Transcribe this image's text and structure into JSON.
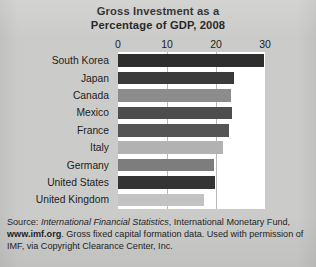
{
  "chart_data": {
    "type": "bar",
    "orientation": "horizontal",
    "title": "Gross Investment as a Percentage of GDP, 2008",
    "title_lines": [
      "Gross Investment as a",
      "Percentage of GDP, 2008"
    ],
    "xlabel": "",
    "ylabel": "",
    "xlim": [
      0,
      30
    ],
    "xticks": [
      0,
      10,
      20,
      30
    ],
    "xtick_labels": [
      "0",
      "10",
      "20",
      "30"
    ],
    "grid": true,
    "grid_axis": "x",
    "legend": "none",
    "categories": [
      "South Korea",
      "Japan",
      "Canada",
      "Mexico",
      "France",
      "Italy",
      "Germany",
      "United States",
      "United Kingdom"
    ],
    "values": [
      29.8,
      23.7,
      23.0,
      23.2,
      22.7,
      21.4,
      19.6,
      19.8,
      17.5
    ],
    "bar_colors": [
      "#2e2e2e",
      "#3a3a3a",
      "#8c8c8c",
      "#4d4d4d",
      "#555555",
      "#b2b2b2",
      "#7d7d7d",
      "#343434",
      "#c3c3c3"
    ]
  },
  "source_note": {
    "line1_prefix": "Source: ",
    "line1_italic": "International Financial Statistics",
    "line1_suffix": ", International Monetary Fund,",
    "line2_bold": "www.imf.org",
    "line2_rest": ". Gross fixed capital formation data. Used with permission",
    "line3": "of IMF, via Copyright Clearance Center, Inc."
  },
  "colors": {
    "background": "#cbcbc9",
    "plot_background": "#ffffff",
    "gridline": "#b9b9b9",
    "text": "#1d1d1d"
  }
}
